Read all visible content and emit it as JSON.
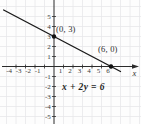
{
  "figure": {
    "background": "#fdfdfd"
  },
  "chart_data": {
    "type": "line",
    "title": "",
    "equation_label": "x + 2y = 6",
    "x_axis_label": "x",
    "xlim": [
      -5.7,
      9.2
    ],
    "ylim": [
      -5.8,
      6.6
    ],
    "grid": true,
    "legend": "none",
    "x_tick_labels": [
      -4,
      -3,
      -2,
      -1,
      1,
      2,
      3,
      4,
      5,
      6
    ],
    "y_tick_labels": [
      5,
      4,
      3,
      2,
      1,
      -1,
      -2,
      -3,
      -4,
      -5
    ],
    "series": [
      {
        "name": "x + 2y = 6",
        "slope": -0.5,
        "y_intercept": 3,
        "x_intercept": 6,
        "x": [
          -5.3,
          7.0
        ],
        "y": [
          5.65,
          -0.5
        ]
      }
    ],
    "marked_points": [
      {
        "x": 0,
        "y": 3,
        "label": "(0, 3)"
      },
      {
        "x": 6,
        "y": 0,
        "label": "(6, 0)"
      }
    ],
    "colors": {
      "axis": "#2b2b2b",
      "line": "#1a1a1a",
      "grid": "#e7e7ea",
      "text": "#3a3a3a",
      "point": "#111111"
    }
  }
}
